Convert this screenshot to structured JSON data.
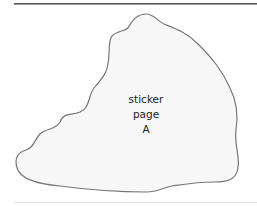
{
  "sticker": {
    "lines": [
      "sticker",
      "page",
      "A"
    ],
    "fill": "#f7f7f7",
    "stroke": "#777777"
  }
}
